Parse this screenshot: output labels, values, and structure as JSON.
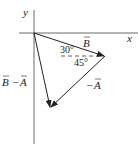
{
  "diagram": {
    "type": "vector-diagram",
    "axes": {
      "x_label": "x",
      "y_label": "y",
      "origin": [
        34,
        33
      ]
    },
    "vectors": [
      {
        "name": "B",
        "label": "B",
        "from": [
          34,
          33
        ],
        "to": [
          105,
          56
        ]
      },
      {
        "name": "neg-A",
        "label": "− A",
        "from": [
          105,
          56
        ],
        "to": [
          50,
          108
        ]
      },
      {
        "name": "B-minus-A",
        "label": "B − A",
        "from": [
          34,
          33
        ],
        "to": [
          50,
          108
        ]
      }
    ],
    "angles": {
      "upper": "30°",
      "lower": "45°"
    },
    "labels": {
      "B": "B",
      "negA_sign": "−",
      "negA_letter": "A",
      "BminusA_B": "B",
      "BminusA_minus": "−",
      "BminusA_A": "A"
    },
    "colors": {
      "line": "#222222",
      "background": "#ffffff"
    }
  }
}
